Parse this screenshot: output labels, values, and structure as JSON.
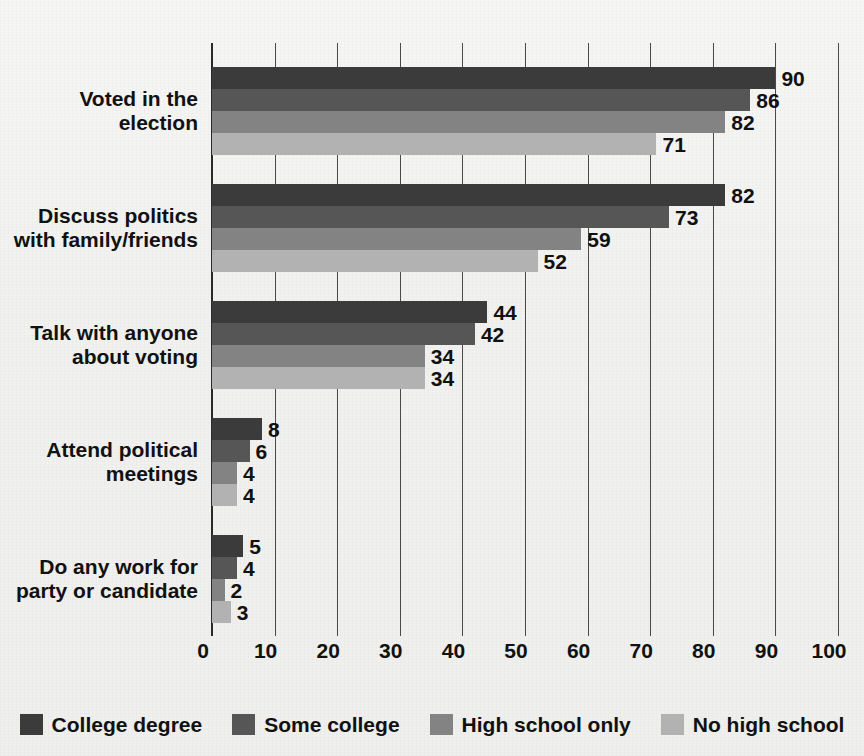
{
  "chart_data": {
    "type": "bar",
    "orientation": "horizontal",
    "title": "",
    "subtitle": "",
    "xlabel": "",
    "ylabel": "",
    "xlim": [
      0,
      100
    ],
    "xticks": [
      0,
      10,
      20,
      30,
      40,
      50,
      60,
      70,
      80,
      90,
      100
    ],
    "xtick_labels": [
      "0",
      "10",
      "20",
      "30",
      "40",
      "50",
      "60",
      "70",
      "80",
      "90",
      "100"
    ],
    "grid": true,
    "grid_axis": "x",
    "legend_position": "bottom",
    "categories": [
      "Voted in the election",
      "Discuss politics\nwith family/friends",
      "Talk with anyone\nabout voting",
      "Attend political\nmeetings",
      "Do any work for\nparty or candidate"
    ],
    "series": [
      {
        "name": "College degree",
        "color": "#3b3b3b",
        "values": [
          90,
          82,
          44,
          8,
          5
        ]
      },
      {
        "name": "Some college",
        "color": "#565656",
        "values": [
          86,
          73,
          42,
          6,
          4
        ]
      },
      {
        "name": "High school only",
        "color": "#838383",
        "values": [
          82,
          59,
          34,
          4,
          2
        ]
      },
      {
        "name": "No high school",
        "color": "#b2b2b2",
        "values": [
          71,
          52,
          34,
          4,
          3
        ]
      }
    ]
  },
  "legend": {
    "items": [
      {
        "label": "College degree",
        "color": "#3b3b3b"
      },
      {
        "label": "Some college",
        "color": "#565656"
      },
      {
        "label": "High school only",
        "color": "#838383"
      },
      {
        "label": "No high school",
        "color": "#b2b2b2"
      }
    ]
  },
  "axis": {
    "tick_labels": [
      "0",
      "10",
      "20",
      "30",
      "40",
      "50",
      "60",
      "70",
      "80",
      "90",
      "100"
    ]
  }
}
